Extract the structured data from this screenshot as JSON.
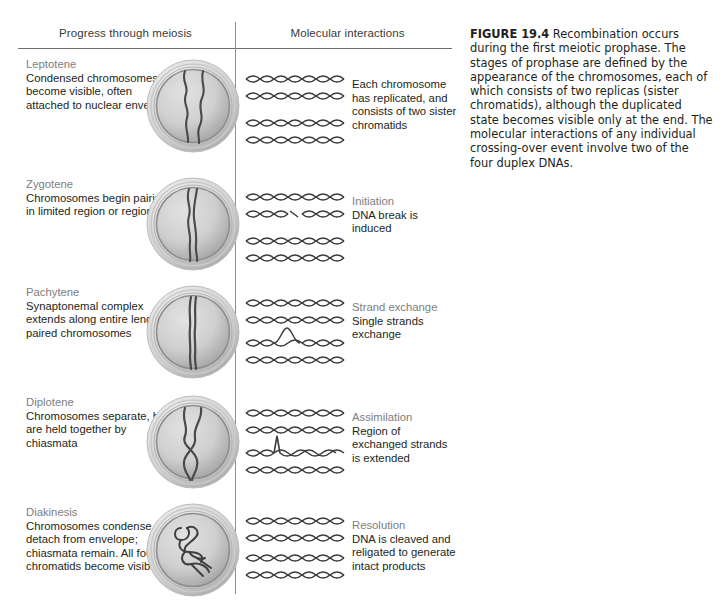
{
  "figure": {
    "columns": {
      "left_header": "Progress through meiosis",
      "right_header": "Molecular interactions"
    },
    "caption": {
      "label": "FIGURE 19.4",
      "text": "  Recombination occurs during the first meiotic prophase. The stages of prophase are defined by the appearance of the chromosomes, each of which consists of two replicas (sister chromatids), although the duplicated state becomes visible only at the end. The molecular interactions of any individual crossing-over event involve two of the four duplex DNAs."
    },
    "rows": [
      {
        "stage": "Leptotene",
        "stage_description": "Condensed chromosomes become visible, often attached to nuclear envelope",
        "molecular_title": "",
        "molecular_description": "Each chromosome has replicated, and consists of two sister chromatids",
        "cell_art": "nucleus-leptotene",
        "dna_art": "four-duplex-dnas"
      },
      {
        "stage": "Zygotene",
        "stage_description": "Chromosomes begin pairing in limited region or regions",
        "molecular_title": "Initiation",
        "molecular_description": "DNA break is induced",
        "cell_art": "nucleus-zygotene",
        "dna_art": "duplex-dnas-with-break"
      },
      {
        "stage": "Pachytene",
        "stage_description": "Synaptonemal complex extends along entire length of paired chromosomes",
        "molecular_title": "Strand exchange",
        "molecular_description": "Single strands exchange",
        "cell_art": "nucleus-pachytene",
        "dna_art": "duplex-dnas-strand-exchange"
      },
      {
        "stage": "Diplotene",
        "stage_description": "Chromosomes separate, but are held together by chiasmata",
        "molecular_title": "Assimilation",
        "molecular_description": "Region of exchanged strands is extended",
        "cell_art": "nucleus-diplotene",
        "dna_art": "duplex-dnas-assimilation"
      },
      {
        "stage": "Diakinesis",
        "stage_description": "Chromosomes condense, detach from envelope; chiasmata remain. All four chromatids become visible",
        "molecular_title": "Resolution",
        "molecular_description": "DNA is cleaved and religated to generate intact products",
        "cell_art": "nucleus-diakinesis",
        "dna_art": "duplex-dnas-resolved"
      }
    ],
    "colors": {
      "text": "#231f20",
      "muted_text": "#7d7e80",
      "rule": "#6d6e71",
      "divider": "#8d8e90",
      "dna_strand": "#3c3c3c",
      "chromosome": "#4a4a4a",
      "nucleus_fill_light": "#d8d8d8",
      "nucleus_fill_dark": "#a6a6a6"
    }
  }
}
